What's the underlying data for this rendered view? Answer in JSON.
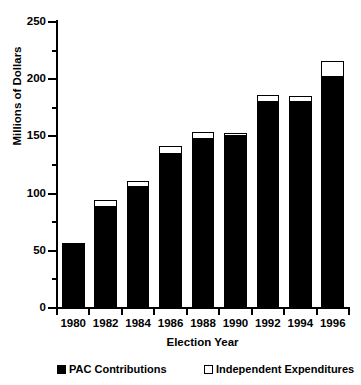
{
  "chart_data": {
    "type": "bar",
    "stacked": true,
    "title": "",
    "xlabel": "Election Year",
    "ylabel": "Millions of Dollars",
    "categories": [
      "1980",
      "1982",
      "1984",
      "1986",
      "1988",
      "1990",
      "1992",
      "1994",
      "1996"
    ],
    "series": [
      {
        "name": "PAC Contributions",
        "color": "#000000",
        "values": [
          57,
          88,
          106,
          135,
          148,
          150,
          180,
          180,
          202
        ]
      },
      {
        "name": "Independent Expenditures",
        "color": "#ffffff",
        "values": [
          0,
          6,
          5,
          7,
          6,
          3,
          6,
          5,
          14
        ]
      }
    ],
    "totals": [
      57,
      94,
      111,
      142,
      154,
      153,
      186,
      185,
      216
    ],
    "ylim": [
      0,
      250
    ],
    "ytick_values": [
      0,
      50,
      100,
      150,
      200,
      250
    ],
    "ytick_labels": [
      "0",
      "50",
      "100",
      "150",
      "200",
      "250"
    ],
    "yminor_values": [
      25,
      75,
      125,
      175,
      225
    ],
    "grid": false,
    "legend_position": "bottom",
    "legend": [
      {
        "label": "PAC Contributions",
        "swatch": "filled-square"
      },
      {
        "label": "Independent Expenditures",
        "swatch": "open-square"
      }
    ]
  }
}
